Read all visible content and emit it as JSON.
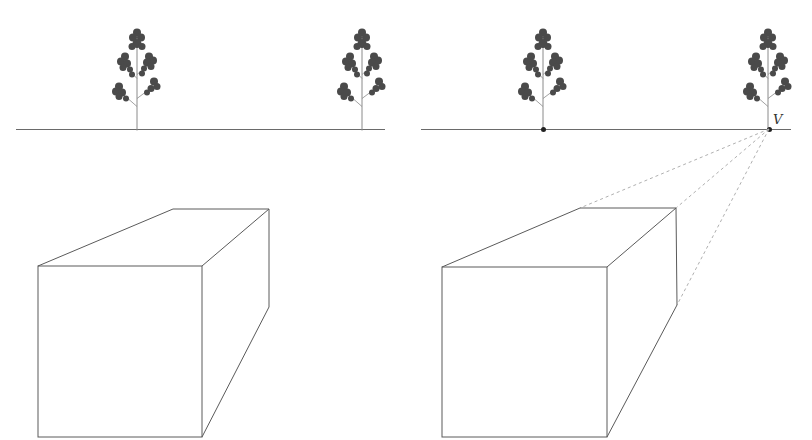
{
  "figure": {
    "colors": {
      "line": "#5a5a5a",
      "construction_line": "#b0b0b0",
      "tree": "#4a4a4a",
      "background": "#ffffff"
    }
  },
  "left_panel": {
    "horizon": {
      "x1": 16,
      "x2": 385,
      "y": 129
    },
    "trees": [
      {
        "trunk_x": 137,
        "base_y": 129
      },
      {
        "trunk_x": 362,
        "base_y": 129
      }
    ],
    "box": {
      "front": {
        "x1": 38,
        "y1": 266,
        "x2": 202,
        "y2": 437
      },
      "back_top_left": [
        173,
        209
      ],
      "back_top_right": [
        269,
        209
      ],
      "back_bottom_right": [
        269,
        307
      ]
    }
  },
  "right_panel": {
    "horizon": {
      "x1": 421,
      "x2": 791,
      "y": 129
    },
    "trees": [
      {
        "trunk_x": 543,
        "base_y": 129
      },
      {
        "trunk_x": 768,
        "base_y": 129
      }
    ],
    "horizon_points": [
      {
        "x": 543,
        "y": 129,
        "label": ""
      },
      {
        "x": 769,
        "y": 129,
        "label": "V"
      }
    ],
    "vanishing_point": {
      "x": 769,
      "y": 129,
      "label": "V"
    },
    "box": {
      "front": {
        "x1": 442,
        "y1": 267,
        "x2": 607,
        "y2": 437
      },
      "back_top_left": [
        580,
        208
      ],
      "back_top_right": [
        676,
        208
      ],
      "back_bottom_right": [
        677,
        305
      ]
    },
    "construction_lines": [
      {
        "from": [
          769,
          129
        ],
        "to": [
          580,
          208
        ]
      },
      {
        "from": [
          769,
          129
        ],
        "to": [
          676,
          208
        ]
      },
      {
        "from": [
          769,
          129
        ],
        "to": [
          677,
          305
        ]
      }
    ]
  }
}
